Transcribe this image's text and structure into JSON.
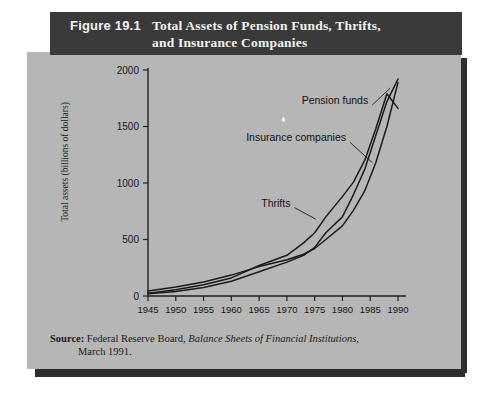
{
  "figure": {
    "number": "Figure 19.1",
    "title_line1": "Total Assets of Pension Funds, Thrifts,",
    "title_line2": "and Insurance Companies",
    "header_bg": "#3a3a3a",
    "panel_bg": "#b6b6b6"
  },
  "source": {
    "label": "Source:",
    "text_before_italic": " Federal Reserve Board, ",
    "italic_text": "Balance Sheets of Financial Institutions",
    "text_after_italic": ",",
    "line2": "March 1991."
  },
  "chart_data": {
    "type": "line",
    "xlabel": "",
    "ylabel": "Total assets (billions of dollars)",
    "xlim": [
      1945,
      1990
    ],
    "ylim": [
      0,
      2000
    ],
    "ytick_labels": [
      "0",
      "500",
      "1000",
      "1500",
      "2000"
    ],
    "yticks": [
      0,
      500,
      1000,
      1500,
      2000
    ],
    "xtick_labels": [
      "1945",
      "1950",
      "1955",
      "1960",
      "1965",
      "1970",
      "1975",
      "1980",
      "1985",
      "1990"
    ],
    "xticks": [
      1945,
      1950,
      1955,
      1960,
      1965,
      1970,
      1975,
      1980,
      1985,
      1990
    ],
    "grid": false,
    "legend": "inline-annotations",
    "x": [
      1945,
      1950,
      1955,
      1960,
      1965,
      1970,
      1973,
      1975,
      1977,
      1980,
      1982,
      1984,
      1986,
      1988,
      1990
    ],
    "series": [
      {
        "name": "Pension funds",
        "label_x": 1972,
        "label_y": 1700,
        "values": [
          20,
          40,
          75,
          130,
          215,
          300,
          360,
          430,
          560,
          700,
          900,
          1120,
          1420,
          1720,
          1920
        ]
      },
      {
        "name": "Insurance companies",
        "label_x": 1965,
        "label_y": 1370,
        "values": [
          45,
          80,
          125,
          185,
          260,
          320,
          370,
          420,
          500,
          620,
          760,
          930,
          1180,
          1500,
          1890
        ]
      },
      {
        "name": "Thrifts",
        "label_x": 1966,
        "label_y": 790,
        "values": [
          25,
          55,
          100,
          160,
          270,
          360,
          470,
          560,
          700,
          880,
          1010,
          1200,
          1480,
          1790,
          1660
        ]
      }
    ]
  }
}
